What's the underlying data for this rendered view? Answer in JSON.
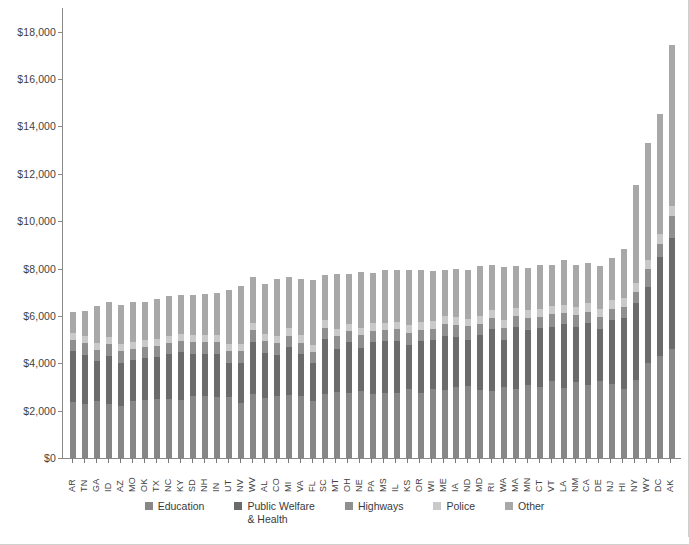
{
  "chart_data": {
    "type": "bar",
    "subtype": "stacked-bar",
    "title": "",
    "xlabel": "",
    "ylabel": "",
    "ylim": [
      0,
      19000
    ],
    "grid": false,
    "legend_position": "bottom",
    "y_tick_labels": [
      "$0",
      "$2,000",
      "$4,000",
      "$6,000",
      "$8,000",
      "$10,000",
      "$12,000",
      "$14,000",
      "$16,000",
      "$18,000"
    ],
    "y_tick_values": [
      0,
      2000,
      4000,
      6000,
      8000,
      10000,
      12000,
      14000,
      16000,
      18000
    ],
    "categories": [
      "AR",
      "TN",
      "GA",
      "ID",
      "AZ",
      "MO",
      "OK",
      "TX",
      "NC",
      "KY",
      "SD",
      "NH",
      "IN",
      "UT",
      "NV",
      "WV",
      "AL",
      "CO",
      "MI",
      "VA",
      "FL",
      "SC",
      "MT",
      "OH",
      "NE",
      "PA",
      "MS",
      "IL",
      "KS",
      "OR",
      "WI",
      "ME",
      "IA",
      "ND",
      "MD",
      "RI",
      "WA",
      "MA",
      "MN",
      "CT",
      "VT",
      "LA",
      "NM",
      "CA",
      "DE",
      "NJ",
      "HI",
      "NY",
      "WY",
      "DC",
      "AK"
    ],
    "series": [
      {
        "name": "Education",
        "color": "#878787",
        "values": [
          2380,
          2270,
          2410,
          2290,
          2200,
          2400,
          2460,
          2500,
          2480,
          2440,
          2600,
          2620,
          2560,
          2570,
          2340,
          2700,
          2520,
          2620,
          2680,
          2620,
          2420,
          2720,
          2800,
          2760,
          2820,
          2700,
          2740,
          2760,
          2900,
          2760,
          2900,
          2860,
          2980,
          3060,
          2880,
          2840,
          3000,
          2920,
          3080,
          3000,
          3240,
          2960,
          3200,
          3080,
          3260,
          3120,
          2920,
          3280,
          4000,
          4320,
          4600
        ]
      },
      {
        "name": "Public Welfare & Health",
        "color": "#6b6b6b",
        "values": [
          2140,
          2100,
          1680,
          2020,
          1820,
          1740,
          1760,
          1760,
          1900,
          2020,
          1780,
          1780,
          1840,
          1460,
          1680,
          2200,
          1920,
          1740,
          2020,
          1780,
          1580,
          2320,
          1820,
          2140,
          1840,
          2200,
          2180,
          2200,
          1880,
          2180,
          2080,
          2300,
          2120,
          1940,
          2320,
          2600,
          2000,
          2600,
          2340,
          2480,
          2300,
          2680,
          2320,
          2620,
          2200,
          2700,
          3000,
          3280,
          3220,
          4180,
          4700
        ]
      },
      {
        "name": "Highways",
        "color": "#8f8f8f",
        "values": [
          470,
          480,
          470,
          500,
          480,
          470,
          470,
          460,
          460,
          470,
          520,
          500,
          480,
          470,
          480,
          500,
          500,
          480,
          470,
          470,
          460,
          470,
          520,
          470,
          520,
          470,
          470,
          470,
          520,
          480,
          480,
          500,
          520,
          560,
          470,
          470,
          480,
          470,
          500,
          470,
          520,
          470,
          500,
          470,
          500,
          480,
          470,
          470,
          760,
          520,
          900
        ]
      },
      {
        "name": "Police",
        "color": "#c9c9c9",
        "values": [
          300,
          300,
          300,
          300,
          300,
          300,
          300,
          300,
          300,
          300,
          300,
          300,
          300,
          300,
          300,
          300,
          300,
          300,
          310,
          310,
          320,
          310,
          310,
          310,
          310,
          320,
          310,
          320,
          320,
          320,
          320,
          320,
          320,
          320,
          340,
          330,
          330,
          340,
          340,
          350,
          340,
          350,
          340,
          360,
          350,
          360,
          350,
          380,
          400,
          420,
          460
        ]
      },
      {
        "name": "Other",
        "color": "#a8a8a8",
        "values": [
          860,
          1060,
          1580,
          1460,
          1660,
          1660,
          1620,
          1700,
          1700,
          1640,
          1680,
          1740,
          1780,
          2280,
          2460,
          1940,
          2120,
          2420,
          2150,
          2400,
          2740,
          1900,
          2300,
          2090,
          2350,
          2110,
          2240,
          2180,
          2320,
          2180,
          2120,
          1960,
          2040,
          2080,
          2080,
          1900,
          2260,
          1760,
          1780,
          1840,
          1760,
          1890,
          1780,
          1720,
          1790,
          1780,
          2100,
          4100,
          4940,
          5100,
          6800
        ]
      }
    ],
    "totals": [
      6150,
      6210,
      6440,
      6570,
      6460,
      6570,
      6610,
      6720,
      6840,
      6870,
      6880,
      6940,
      6960,
      7080,
      7260,
      7640,
      7360,
      7260,
      7630,
      7580,
      7520,
      7720,
      7750,
      7770,
      7840,
      7800,
      7940,
      7930,
      7940,
      7920,
      7900,
      7940,
      7980,
      7960,
      8090,
      8140,
      8070,
      8090,
      8040,
      8140,
      8160,
      8350,
      8140,
      8250,
      8100,
      8440,
      8840,
      11510,
      13320,
      16540,
      17460
    ]
  },
  "legend": {
    "items": [
      {
        "label": "Education",
        "color": "#878787"
      },
      {
        "label": "Public Welfare\n& Health",
        "color": "#6b6b6b"
      },
      {
        "label": "Highways",
        "color": "#8f8f8f"
      },
      {
        "label": "Police",
        "color": "#c9c9c9"
      },
      {
        "label": "Other",
        "color": "#a8a8a8"
      }
    ]
  }
}
